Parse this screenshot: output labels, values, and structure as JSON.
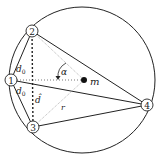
{
  "diagram": {
    "nodes": [
      {
        "id": "1",
        "label": "1",
        "x": 11,
        "y": 80
      },
      {
        "id": "2",
        "label": "2",
        "x": 32,
        "y": 31
      },
      {
        "id": "3",
        "label": "3",
        "x": 33,
        "y": 127
      },
      {
        "id": "4",
        "label": "4",
        "x": 147,
        "y": 105
      }
    ],
    "center": {
      "label": "m",
      "x": 84,
      "y": 80
    },
    "labels": {
      "d0_upper": "d",
      "d0_lower": "d",
      "sub0": "0",
      "d_hat": "d̂",
      "alpha": "α",
      "r": "r",
      "m": "m"
    },
    "circle": {
      "cx": 82,
      "cy": 80,
      "r": 73
    }
  }
}
